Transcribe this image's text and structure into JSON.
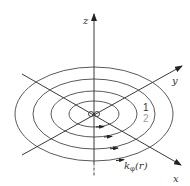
{
  "diagram": {
    "axes": {
      "z_label": "z",
      "y_label": "y",
      "x_label": "x"
    },
    "field_label": {
      "k": "k",
      "subscript": "φ",
      "arg": "(r)"
    },
    "ring_labels": {
      "first": "1",
      "second": "2"
    },
    "colors": {
      "line": "#3a3a3a",
      "ring": "#5a5a5a",
      "label_1": "#333333",
      "label_2": "#9a9a9a"
    },
    "rings": [
      {
        "rx": 25,
        "ry": 13
      },
      {
        "rx": 43,
        "ry": 21
      },
      {
        "rx": 61,
        "ry": 34
      },
      {
        "rx": 79,
        "ry": 47
      }
    ],
    "center": {
      "x": 94,
      "y": 114
    }
  }
}
